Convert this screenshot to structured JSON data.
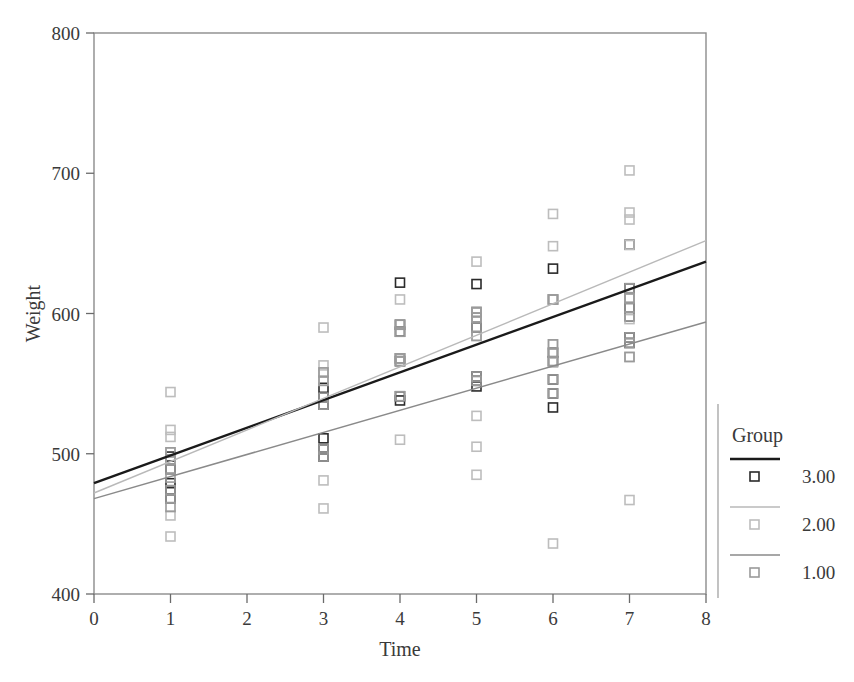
{
  "chart_data": {
    "type": "scatter",
    "title": "",
    "subtitle": "",
    "xlabel": "Time",
    "ylabel": "Weight",
    "xlim": [
      0,
      8
    ],
    "ylim": [
      400,
      800
    ],
    "xticks": [
      0,
      1,
      2,
      3,
      4,
      5,
      6,
      7,
      8
    ],
    "yticks": [
      400,
      500,
      600,
      700,
      800
    ],
    "xticklabels": [
      "0",
      "1",
      "2",
      "3",
      "4",
      "5",
      "6",
      "7",
      "8"
    ],
    "yticklabels": [
      "400",
      "500",
      "600",
      "700",
      "800"
    ],
    "grid": false,
    "frame": true,
    "legend": {
      "title": "Group",
      "position": "right",
      "entries": [
        {
          "label": "3.00",
          "line_color": "#1a1a1a",
          "line_width": 2.4,
          "marker_color": "#2a2a2a",
          "marker": "open-square"
        },
        {
          "label": "2.00",
          "line_color": "#b9b9b9",
          "line_width": 1.4,
          "marker_color": "#bdbdbd",
          "marker": "open-square"
        },
        {
          "label": "1.00",
          "line_color": "#8a8a8a",
          "line_width": 1.5,
          "marker_color": "#9a9a9a",
          "marker": "open-square"
        }
      ]
    },
    "fit_lines": [
      {
        "name": "3.00",
        "color": "#1a1a1a",
        "width": 2.4,
        "x": [
          0,
          8
        ],
        "y": [
          479,
          637
        ]
      },
      {
        "name": "2.00",
        "color": "#b9b9b9",
        "width": 1.4,
        "x": [
          0,
          8
        ],
        "y": [
          472,
          652
        ]
      },
      {
        "name": "1.00",
        "color": "#8a8a8a",
        "width": 1.5,
        "x": [
          0,
          8
        ],
        "y": [
          468,
          594
        ]
      }
    ],
    "series": [
      {
        "name": "3.00",
        "marker": "open-square",
        "color": "#2a2a2a",
        "points": [
          [
            1,
            498
          ],
          [
            1,
            489
          ],
          [
            1,
            479
          ],
          [
            1,
            474
          ],
          [
            1,
            468
          ],
          [
            3,
            547
          ],
          [
            3,
            540
          ],
          [
            3,
            535
          ],
          [
            3,
            511
          ],
          [
            3,
            503
          ],
          [
            3,
            498
          ],
          [
            4,
            622
          ],
          [
            4,
            592
          ],
          [
            4,
            587
          ],
          [
            4,
            568
          ],
          [
            4,
            566
          ],
          [
            4,
            541
          ],
          [
            4,
            538
          ],
          [
            5,
            621
          ],
          [
            5,
            601
          ],
          [
            5,
            597
          ],
          [
            5,
            590
          ],
          [
            5,
            555
          ],
          [
            5,
            552
          ],
          [
            5,
            548
          ],
          [
            6,
            632
          ],
          [
            6,
            610
          ],
          [
            6,
            572
          ],
          [
            6,
            566
          ],
          [
            6,
            553
          ],
          [
            6,
            543
          ],
          [
            6,
            533
          ],
          [
            7,
            649
          ],
          [
            7,
            618
          ],
          [
            7,
            611
          ],
          [
            7,
            604
          ],
          [
            7,
            598
          ],
          [
            7,
            583
          ],
          [
            7,
            579
          ]
        ]
      },
      {
        "name": "2.00",
        "marker": "open-square",
        "color": "#bdbdbd",
        "points": [
          [
            1,
            544
          ],
          [
            1,
            517
          ],
          [
            1,
            512
          ],
          [
            1,
            501
          ],
          [
            1,
            496
          ],
          [
            1,
            456
          ],
          [
            1,
            441
          ],
          [
            3,
            590
          ],
          [
            3,
            563
          ],
          [
            3,
            558
          ],
          [
            3,
            552
          ],
          [
            3,
            481
          ],
          [
            3,
            461
          ],
          [
            4,
            610
          ],
          [
            4,
            592
          ],
          [
            4,
            568
          ],
          [
            4,
            566
          ],
          [
            4,
            510
          ],
          [
            5,
            637
          ],
          [
            5,
            601
          ],
          [
            5,
            597
          ],
          [
            5,
            584
          ],
          [
            5,
            527
          ],
          [
            5,
            505
          ],
          [
            5,
            485
          ],
          [
            6,
            671
          ],
          [
            6,
            648
          ],
          [
            6,
            610
          ],
          [
            6,
            578
          ],
          [
            6,
            565
          ],
          [
            6,
            436
          ],
          [
            7,
            702
          ],
          [
            7,
            672
          ],
          [
            7,
            667
          ],
          [
            7,
            649
          ],
          [
            7,
            611
          ],
          [
            7,
            596
          ],
          [
            7,
            569
          ],
          [
            7,
            467
          ]
        ]
      },
      {
        "name": "1.00",
        "marker": "open-square",
        "color": "#9a9a9a",
        "points": [
          [
            1,
            501
          ],
          [
            1,
            496
          ],
          [
            1,
            489
          ],
          [
            1,
            483
          ],
          [
            1,
            474
          ],
          [
            1,
            468
          ],
          [
            1,
            462
          ],
          [
            3,
            558
          ],
          [
            3,
            552
          ],
          [
            3,
            540
          ],
          [
            3,
            535
          ],
          [
            3,
            503
          ],
          [
            3,
            498
          ],
          [
            4,
            592
          ],
          [
            4,
            587
          ],
          [
            4,
            568
          ],
          [
            4,
            566
          ],
          [
            4,
            541
          ],
          [
            5,
            601
          ],
          [
            5,
            597
          ],
          [
            5,
            590
          ],
          [
            5,
            584
          ],
          [
            5,
            555
          ],
          [
            5,
            552
          ],
          [
            6,
            610
          ],
          [
            6,
            578
          ],
          [
            6,
            572
          ],
          [
            6,
            566
          ],
          [
            6,
            553
          ],
          [
            6,
            543
          ],
          [
            7,
            618
          ],
          [
            7,
            611
          ],
          [
            7,
            604
          ],
          [
            7,
            598
          ],
          [
            7,
            583
          ],
          [
            7,
            579
          ],
          [
            7,
            569
          ]
        ]
      }
    ]
  }
}
